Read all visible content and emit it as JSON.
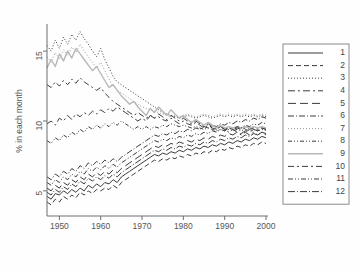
{
  "chart_data": {
    "type": "line",
    "title": "",
    "subtitle": "",
    "xlabel": "",
    "ylabel": "% in each month",
    "xlim": [
      1947,
      2000
    ],
    "ylim": [
      3.2,
      16.8
    ],
    "xticks": [
      1950,
      1960,
      1970,
      1980,
      1990,
      2000
    ],
    "yticks": [
      5,
      10,
      15
    ],
    "grid": false,
    "legend_position": "right-outside",
    "legend_title": "",
    "x": [
      1947,
      1948,
      1949,
      1950,
      1951,
      1952,
      1953,
      1954,
      1955,
      1956,
      1957,
      1958,
      1959,
      1960,
      1961,
      1962,
      1963,
      1964,
      1965,
      1966,
      1967,
      1968,
      1969,
      1970,
      1971,
      1972,
      1973,
      1974,
      1975,
      1976,
      1977,
      1978,
      1979,
      1980,
      1981,
      1982,
      1983,
      1984,
      1985,
      1986,
      1987,
      1988,
      1989,
      1990,
      1991,
      1992,
      1993,
      1994,
      1995,
      1996,
      1997,
      1998,
      1999,
      2000
    ],
    "series": [
      {
        "name": "1",
        "label": "1",
        "style": "solid",
        "color": "#3b3b3b",
        "width": 1.0,
        "dash": "none",
        "values": [
          4.6,
          4.4,
          4.8,
          4.7,
          5.0,
          4.8,
          5.1,
          4.9,
          5.2,
          5.0,
          5.4,
          5.2,
          5.5,
          5.3,
          5.6,
          5.5,
          5.8,
          5.6,
          6.0,
          6.2,
          6.4,
          6.6,
          6.8,
          7.0,
          7.2,
          7.4,
          7.6,
          7.5,
          7.7,
          7.6,
          7.8,
          7.7,
          7.9,
          7.8,
          8.0,
          7.9,
          8.1,
          8.0,
          8.2,
          8.1,
          8.3,
          8.2,
          8.4,
          8.3,
          8.5,
          8.4,
          8.6,
          8.5,
          8.7,
          8.6,
          8.8,
          8.7,
          8.9,
          8.8
        ]
      },
      {
        "name": "2",
        "label": "2",
        "style": "dashed",
        "color": "#3b3b3b",
        "width": 1.0,
        "dash": "5,3",
        "values": [
          4.2,
          4.0,
          4.4,
          4.2,
          4.6,
          4.4,
          4.7,
          4.5,
          4.9,
          4.7,
          5.0,
          4.8,
          5.1,
          5.0,
          5.2,
          5.1,
          5.4,
          5.2,
          5.6,
          5.8,
          6.0,
          6.2,
          6.4,
          6.6,
          6.8,
          7.0,
          7.2,
          7.1,
          7.3,
          7.2,
          7.4,
          7.3,
          7.5,
          7.4,
          7.6,
          7.5,
          7.7,
          7.6,
          7.8,
          7.7,
          7.9,
          7.8,
          8.0,
          7.9,
          8.1,
          8.0,
          8.2,
          8.1,
          8.3,
          8.2,
          8.4,
          8.3,
          8.5,
          8.4
        ]
      },
      {
        "name": "3",
        "label": "3",
        "style": "dotted",
        "color": "#3b3b3b",
        "width": 1.0,
        "dash": "1,2",
        "values": [
          15.4,
          15.0,
          15.8,
          15.2,
          16.0,
          15.5,
          16.2,
          15.8,
          16.4,
          15.9,
          15.5,
          15.0,
          14.6,
          15.2,
          14.4,
          13.8,
          13.2,
          12.8,
          12.6,
          12.4,
          12.2,
          12.0,
          11.8,
          11.6,
          11.4,
          11.2,
          11.0,
          10.8,
          10.6,
          10.5,
          10.4,
          10.3,
          10.2,
          10.3,
          10.4,
          10.3,
          10.2,
          10.3,
          10.4,
          10.3,
          10.2,
          10.3,
          10.4,
          10.3,
          10.4,
          10.3,
          10.4,
          10.3,
          10.4,
          10.3,
          10.4,
          10.3,
          10.4,
          10.3
        ]
      },
      {
        "name": "4",
        "label": "4",
        "style": "dashdot",
        "color": "#3b3b3b",
        "width": 1.0,
        "dash": "7,3,2,3",
        "values": [
          9.8,
          10.0,
          9.7,
          10.2,
          10.0,
          10.4,
          10.1,
          10.5,
          10.3,
          10.6,
          10.4,
          10.7,
          10.5,
          10.8,
          10.6,
          10.9,
          10.7,
          11.0,
          10.8,
          10.6,
          10.4,
          10.2,
          10.0,
          10.2,
          10.0,
          10.4,
          10.2,
          10.5,
          10.3,
          10.1,
          10.4,
          10.2,
          10.0,
          10.2,
          10.0,
          9.8,
          10.0,
          9.8,
          9.6,
          9.8,
          9.6,
          9.4,
          9.6,
          9.4,
          9.2,
          9.4,
          9.2,
          9.0,
          9.2,
          9.0,
          9.2,
          9.0,
          9.2,
          9.0
        ]
      },
      {
        "name": "5",
        "label": "5",
        "style": "long-dashed",
        "color": "#3b3b3b",
        "width": 1.0,
        "dash": "8,4",
        "values": [
          5.2,
          5.0,
          5.4,
          5.2,
          5.6,
          5.4,
          5.8,
          5.6,
          6.0,
          5.8,
          6.2,
          6.0,
          6.3,
          6.1,
          6.4,
          6.2,
          6.5,
          6.3,
          6.6,
          6.8,
          7.0,
          7.2,
          7.4,
          7.6,
          7.8,
          8.0,
          8.2,
          8.1,
          8.3,
          8.2,
          8.4,
          8.3,
          8.5,
          8.4,
          8.6,
          8.5,
          8.7,
          8.6,
          8.8,
          8.7,
          8.9,
          8.8,
          9.0,
          8.9,
          9.1,
          9.0,
          9.2,
          9.1,
          9.3,
          9.2,
          9.4,
          9.3,
          9.5,
          9.4
        ]
      },
      {
        "name": "6",
        "label": "6",
        "style": "dash-dot-short",
        "color": "#3b3b3b",
        "width": 1.0,
        "dash": "6,2,1,2",
        "values": [
          6.0,
          5.8,
          6.2,
          6.0,
          6.4,
          6.2,
          6.6,
          6.4,
          6.8,
          6.6,
          7.0,
          6.8,
          7.1,
          6.9,
          7.2,
          7.0,
          7.3,
          7.1,
          7.4,
          7.6,
          7.8,
          8.0,
          8.2,
          8.4,
          8.6,
          8.8,
          9.0,
          8.9,
          9.1,
          9.0,
          9.2,
          9.1,
          9.3,
          9.2,
          9.4,
          9.3,
          9.5,
          9.4,
          9.6,
          9.5,
          9.7,
          9.6,
          9.8,
          9.7,
          9.9,
          9.8,
          10.0,
          9.9,
          10.1,
          10.0,
          10.2,
          10.1,
          10.3,
          10.2
        ]
      },
      {
        "name": "7",
        "label": "7",
        "style": "fine-dotted",
        "color": "#9a9a9a",
        "width": 1.0,
        "dash": "1,2",
        "values": [
          14.6,
          14.2,
          14.9,
          14.4,
          15.1,
          14.7,
          15.3,
          14.9,
          15.5,
          15.0,
          14.6,
          14.2,
          13.8,
          14.2,
          13.6,
          13.0,
          12.5,
          12.2,
          12.0,
          11.8,
          11.6,
          11.4,
          11.2,
          11.0,
          10.9,
          10.8,
          10.7,
          10.6,
          10.5,
          10.4,
          10.3,
          10.4,
          10.3,
          10.4,
          10.5,
          10.4,
          10.3,
          10.4,
          10.5,
          10.4,
          10.3,
          10.4,
          10.5,
          10.4,
          10.5,
          10.4,
          10.5,
          10.4,
          10.5,
          10.4,
          10.5,
          10.4,
          10.5,
          10.4
        ]
      },
      {
        "name": "8",
        "label": "8",
        "style": "dash-dot-dot",
        "color": "#3b3b3b",
        "width": 1.0,
        "dash": "4,2,1,2,1,2",
        "values": [
          8.6,
          8.4,
          8.8,
          8.6,
          9.0,
          8.8,
          9.2,
          9.0,
          9.4,
          9.2,
          9.6,
          9.4,
          9.7,
          9.5,
          9.8,
          9.6,
          9.9,
          9.7,
          10.0,
          9.8,
          9.6,
          9.4,
          9.6,
          9.4,
          9.6,
          9.4,
          9.6,
          9.5,
          9.7,
          9.6,
          9.8,
          9.7,
          9.6,
          9.7,
          9.6,
          9.5,
          9.6,
          9.5,
          9.4,
          9.5,
          9.4,
          9.3,
          9.4,
          9.3,
          9.4,
          9.3,
          9.4,
          9.3,
          9.4,
          9.3,
          9.4,
          9.3,
          9.4,
          9.3
        ]
      },
      {
        "name": "9",
        "label": "9",
        "style": "solid-light",
        "color": "#b8b8b8",
        "width": 1.4,
        "dash": "none",
        "values": [
          13.8,
          14.4,
          13.9,
          14.8,
          14.3,
          15.0,
          14.5,
          15.2,
          14.8,
          14.4,
          14.0,
          13.6,
          13.9,
          13.4,
          12.9,
          12.4,
          12.6,
          12.2,
          11.8,
          11.5,
          11.2,
          11.4,
          11.0,
          10.7,
          10.4,
          10.9,
          10.6,
          11.0,
          10.7,
          10.4,
          10.8,
          10.5,
          10.2,
          10.4,
          10.1,
          9.9,
          10.1,
          9.9,
          9.7,
          9.9,
          9.7,
          9.5,
          9.7,
          9.5,
          9.6,
          9.5,
          9.6,
          9.5,
          9.6,
          9.5,
          9.6,
          9.5,
          9.6,
          9.5
        ]
      },
      {
        "name": "10",
        "label": "10",
        "style": "dash-dot-long",
        "color": "#3b3b3b",
        "width": 1.0,
        "dash": "6,3,2,3",
        "values": [
          12.6,
          12.4,
          12.8,
          12.5,
          12.9,
          12.6,
          13.0,
          12.7,
          13.1,
          12.8,
          12.6,
          12.4,
          12.2,
          12.4,
          12.0,
          11.7,
          11.4,
          11.2,
          11.0,
          10.8,
          10.6,
          10.4,
          10.6,
          10.4,
          10.2,
          10.4,
          10.2,
          10.3,
          10.1,
          10.0,
          10.2,
          10.0,
          9.8,
          10.0,
          9.8,
          9.7,
          9.9,
          9.7,
          9.5,
          9.7,
          9.5,
          9.4,
          9.6,
          9.4,
          9.5,
          9.4,
          9.5,
          9.4,
          9.5,
          9.4,
          9.5,
          9.4,
          9.5,
          9.4
        ]
      },
      {
        "name": "11",
        "label": "11",
        "style": "dash-dot-dot-2",
        "color": "#3b3b3b",
        "width": 1.0,
        "dash": "5,2,1,2,1,2",
        "values": [
          5.6,
          5.4,
          5.8,
          5.6,
          6.0,
          5.8,
          6.2,
          6.0,
          6.4,
          6.2,
          6.6,
          6.4,
          6.7,
          6.5,
          6.8,
          6.6,
          6.9,
          6.7,
          7.0,
          7.2,
          7.4,
          7.6,
          7.8,
          8.0,
          8.2,
          8.4,
          8.6,
          8.5,
          8.7,
          8.6,
          8.8,
          8.7,
          8.9,
          8.8,
          9.0,
          8.9,
          9.1,
          9.0,
          9.2,
          9.1,
          9.3,
          9.2,
          9.4,
          9.3,
          9.5,
          9.4,
          9.6,
          9.5,
          9.7,
          9.6,
          9.8,
          9.7,
          9.9,
          9.8
        ]
      },
      {
        "name": "12",
        "label": "12",
        "style": "dash-dot-alt",
        "color": "#3b3b3b",
        "width": 1.0,
        "dash": "7,2,1,2",
        "values": [
          4.9,
          4.7,
          5.1,
          4.9,
          5.3,
          5.1,
          5.5,
          5.3,
          5.7,
          5.5,
          5.9,
          5.7,
          6.0,
          5.8,
          6.1,
          5.9,
          6.2,
          6.0,
          6.3,
          6.5,
          6.7,
          6.9,
          7.1,
          7.3,
          7.5,
          7.7,
          7.9,
          7.8,
          8.0,
          7.9,
          8.1,
          8.0,
          8.2,
          8.1,
          8.3,
          8.2,
          8.4,
          8.3,
          8.5,
          8.4,
          8.6,
          8.5,
          8.7,
          8.6,
          8.8,
          8.7,
          8.9,
          8.8,
          9.0,
          8.9,
          9.1,
          9.0,
          9.2,
          9.1
        ]
      }
    ]
  }
}
